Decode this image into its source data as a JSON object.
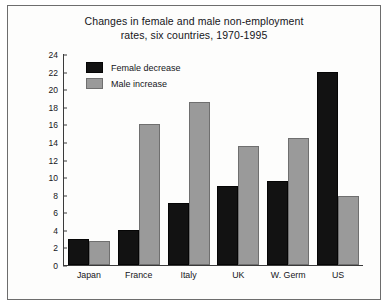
{
  "chart_data": {
    "type": "bar",
    "title": "Changes in female and male non-employment rates, six countries, 1970-1995",
    "title_line1": "Changes in female and male non-employment",
    "title_line2": "rates, six countries, 1970-1995",
    "xlabel": "",
    "ylabel": "",
    "ylim": [
      0,
      24
    ],
    "ytick_step": 2,
    "grid": false,
    "legend_position": "top-left inside plot",
    "categories": [
      "Japan",
      "France",
      "Italy",
      "UK",
      "W. Germ",
      "US"
    ],
    "yticks": [
      "0",
      "2",
      "4",
      "6",
      "8",
      "10",
      "12",
      "14",
      "16",
      "18",
      "20",
      "22",
      "24"
    ],
    "series": [
      {
        "name": "Female decrease",
        "color": "#121212",
        "values": [
          3,
          4,
          7,
          9,
          9.5,
          22
        ]
      },
      {
        "name": "Male increase",
        "color": "#9a9a9a",
        "values": [
          2.7,
          16,
          18.5,
          13.5,
          14.5,
          7.8
        ]
      }
    ]
  }
}
